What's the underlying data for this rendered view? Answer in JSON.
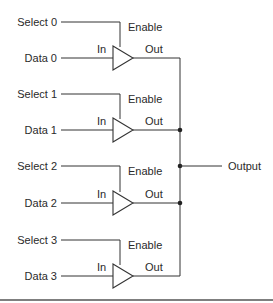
{
  "diagram": {
    "title": "",
    "type": "tri-state buffer multiplexer",
    "buffers": [
      {
        "select_label": "Select 0",
        "data_label": "Data 0",
        "in_label": "In",
        "enable_label": "Enable",
        "out_label": "Out"
      },
      {
        "select_label": "Select 1",
        "data_label": "Data 1",
        "in_label": "In",
        "enable_label": "Enable",
        "out_label": "Out"
      },
      {
        "select_label": "Select 2",
        "data_label": "Data 2",
        "in_label": "In",
        "enable_label": "Enable",
        "out_label": "Out"
      },
      {
        "select_label": "Select 3",
        "data_label": "Data 3",
        "in_label": "In",
        "enable_label": "Enable",
        "out_label": "Out"
      }
    ],
    "output_label": "Output",
    "colors": {
      "line": "#333333",
      "text": "#2a2a2a",
      "background": "#ffffff"
    }
  }
}
